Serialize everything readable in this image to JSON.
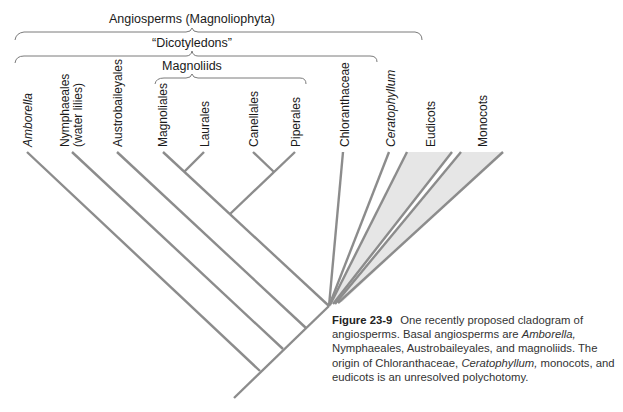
{
  "brackets": {
    "angiosperms": "Angiosperms (Magnoliophyta)",
    "dicotyledons": "“Dicotyledons”",
    "magnoliids": "Magnoliids"
  },
  "taxa": [
    {
      "label": "Amborella",
      "italic": true
    },
    {
      "label": "Nymphaeales",
      "sublabel": "(water lilies)",
      "italic": false
    },
    {
      "label": "Austrobaileyales",
      "italic": false
    },
    {
      "label": "Magnoliales",
      "italic": false
    },
    {
      "label": "Laurales",
      "italic": false
    },
    {
      "label": "Canellales",
      "italic": false
    },
    {
      "label": "Piperales",
      "italic": false
    },
    {
      "label": "Chloranthaceae",
      "italic": false
    },
    {
      "label": "Ceratophyllum",
      "italic": true
    },
    {
      "label": "Eudicots",
      "italic": false
    },
    {
      "label": "Monocots",
      "italic": false
    }
  ],
  "caption": {
    "figure_number": "Figure 23-9",
    "text_1": "One recently proposed cladogram of angiosperms. Basal angiosperms are ",
    "italic_1": "Amborella,",
    "text_2": " Nymphaeales, Austrobaileyales, and magnoliids. The origin of Chloranthaceae, ",
    "italic_2": "Ceratophyllum,",
    "text_3": " monocots, and eudicots is an unresolved polychotomy."
  },
  "colors": {
    "branch": "#8c8c8c",
    "clade_fill": "#e6e6e6",
    "bracket": "#7a7a7a",
    "text": "#1a1a1a"
  }
}
